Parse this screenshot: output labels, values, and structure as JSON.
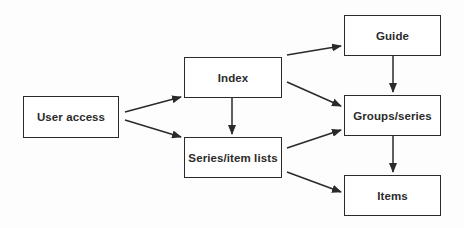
{
  "diagram": {
    "nodes": [
      {
        "id": "user_access",
        "label": "User access"
      },
      {
        "id": "index",
        "label": "Index"
      },
      {
        "id": "series_item_lists",
        "label": "Series/item lists"
      },
      {
        "id": "guide",
        "label": "Guide"
      },
      {
        "id": "groups_series",
        "label": "Groups/series"
      },
      {
        "id": "items",
        "label": "Items"
      }
    ],
    "edges": [
      {
        "from": "user_access",
        "to": "index"
      },
      {
        "from": "user_access",
        "to": "series_item_lists"
      },
      {
        "from": "index",
        "to": "series_item_lists"
      },
      {
        "from": "index",
        "to": "guide"
      },
      {
        "from": "index",
        "to": "groups_series"
      },
      {
        "from": "series_item_lists",
        "to": "groups_series"
      },
      {
        "from": "series_item_lists",
        "to": "items"
      },
      {
        "from": "guide",
        "to": "groups_series"
      },
      {
        "from": "groups_series",
        "to": "items"
      }
    ],
    "colors": {
      "stroke": "#2a2a2a",
      "text": "#2b2b2b",
      "background": "#ffffff"
    }
  }
}
